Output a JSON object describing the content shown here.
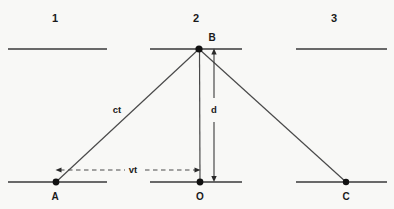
{
  "figure": {
    "background_color": "#f8f8f6",
    "stroke_color": "#3a3a3a",
    "text_color": "#1a1a1a",
    "width": 394,
    "height": 209
  },
  "frames": [
    {
      "id": "frame-1",
      "label": "1",
      "x": 55,
      "y": 18
    },
    {
      "id": "frame-2",
      "label": "2",
      "x": 196,
      "y": 18
    },
    {
      "id": "frame-3",
      "label": "3",
      "x": 334,
      "y": 18
    }
  ],
  "top_rails": [
    {
      "id": "top-rail-1",
      "x1": 8,
      "x2": 107,
      "y": 49
    },
    {
      "id": "top-rail-2",
      "x1": 150,
      "x2": 242,
      "y": 49
    },
    {
      "id": "top-rail-3",
      "x1": 296,
      "x2": 387,
      "y": 49
    }
  ],
  "bottom_rails": [
    {
      "id": "bottom-rail-1",
      "x1": 8,
      "x2": 107,
      "y": 182
    },
    {
      "id": "bottom-rail-2",
      "x1": 150,
      "x2": 242,
      "y": 182
    },
    {
      "id": "bottom-rail-3",
      "x1": 296,
      "x2": 387,
      "y": 182
    }
  ],
  "points": [
    {
      "id": "point-a",
      "label": "A",
      "x": 56,
      "y": 182,
      "label_x": 55,
      "label_y": 197
    },
    {
      "id": "point-o",
      "label": "O",
      "x": 200,
      "y": 182,
      "label_x": 200,
      "label_y": 197
    },
    {
      "id": "point-b",
      "label": "B",
      "x": 199,
      "y": 49,
      "label_x": 212,
      "label_y": 38
    },
    {
      "id": "point-c",
      "label": "C",
      "x": 346,
      "y": 182,
      "label_x": 346,
      "label_y": 197
    }
  ],
  "rays": [
    {
      "id": "ray-ab",
      "from": "A",
      "to": "B",
      "x1": 56,
      "y1": 182,
      "x2": 199,
      "y2": 49
    },
    {
      "id": "ray-bo",
      "from": "B",
      "to": "O",
      "x1": 199,
      "y1": 49,
      "x2": 200,
      "y2": 182
    },
    {
      "id": "ray-bc",
      "from": "B",
      "to": "C",
      "x1": 199,
      "y1": 49,
      "x2": 346,
      "y2": 182
    }
  ],
  "measures": {
    "hypotenuse": {
      "id": "measure-ct",
      "label": "ct",
      "x": 117,
      "y": 110
    },
    "vertical": {
      "id": "measure-d",
      "label": "d",
      "x": 214,
      "y": 110,
      "line_x": 214,
      "y_top": 50,
      "y_bottom": 181
    },
    "horizontal": {
      "id": "measure-vt",
      "label": "vt",
      "x": 133,
      "y": 170,
      "y_line": 170,
      "x_left": 56,
      "x_right": 200,
      "dash_left_end": 125,
      "dash_right_start": 145
    }
  }
}
